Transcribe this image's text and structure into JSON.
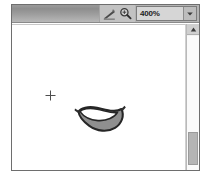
{
  "window": {
    "title": "",
    "background_color": "#ffffff",
    "frame_color": "#6e6e6e"
  },
  "toolbar": {
    "background_color": "#b4b4b4",
    "drag_area_label": "",
    "tools": [
      {
        "name": "pencil-tool-icon",
        "label": "Pencil Tool"
      },
      {
        "name": "zoom-tool-icon",
        "label": "Zoom Tool"
      }
    ],
    "zoom": {
      "value": "400%",
      "placeholder": "100%",
      "dropdown_glyph": "▼",
      "options": [
        "25%",
        "50%",
        "100%",
        "200%",
        "400%",
        "800%"
      ]
    }
  },
  "canvas": {
    "background_color": "#ffffff",
    "crosshair": {
      "name": "crosshair-marker",
      "x": 33,
      "y": 62
    },
    "artwork": {
      "name": "banana-shape",
      "outline_color": "#262626",
      "fill_color": "#8f8f8f",
      "highlight_color": "#ffffff"
    }
  },
  "scrollbar": {
    "up_arrow_glyph": "▲",
    "track_color": "#fafafa",
    "thumb_color": "#b5b5b5",
    "thumb_position": 96
  }
}
